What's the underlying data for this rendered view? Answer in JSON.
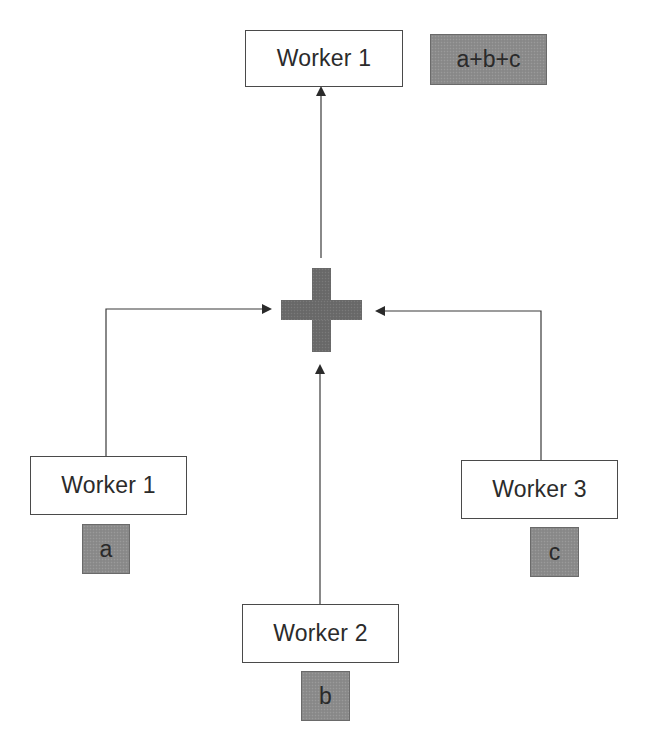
{
  "diagram": {
    "title": "",
    "type": "all-reduce sum",
    "result": {
      "worker": {
        "label": "Worker 1"
      },
      "value": {
        "label": "a+b+c"
      }
    },
    "operator": {
      "icon": "plus-icon",
      "meaning": "sum"
    },
    "inputs": [
      {
        "worker": {
          "label": "Worker 1"
        },
        "value": {
          "label": "a"
        }
      },
      {
        "worker": {
          "label": "Worker 2"
        },
        "value": {
          "label": "b"
        }
      },
      {
        "worker": {
          "label": "Worker 3"
        },
        "value": {
          "label": "c"
        }
      }
    ],
    "edges": [
      {
        "from": "Worker 1 (input)",
        "to": "plus"
      },
      {
        "from": "Worker 2 (input)",
        "to": "plus"
      },
      {
        "from": "Worker 3 (input)",
        "to": "plus"
      },
      {
        "from": "plus",
        "to": "Worker 1 (result)"
      }
    ],
    "colors": {
      "box_border": "#4a4a4a",
      "value_fill": "#8c8c8c",
      "operator_fill": "#6b6b6b",
      "line": "#3a3a3a",
      "text": "#2b2b2b"
    }
  }
}
